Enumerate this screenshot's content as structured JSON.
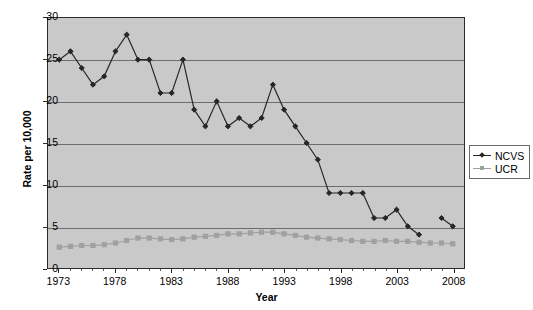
{
  "chart_data": {
    "type": "line",
    "title": "",
    "xlabel": "Year",
    "ylabel": "Rate per 10,000",
    "xlim": [
      1972,
      2009
    ],
    "ylim": [
      0,
      30
    ],
    "ytick_values": [
      0,
      5,
      10,
      15,
      20,
      25,
      30
    ],
    "ytick_labels": [
      "0",
      "5",
      "10",
      "15",
      "20",
      "25",
      "30"
    ],
    "xtick_values": [
      1973,
      1978,
      1983,
      1988,
      1993,
      1998,
      2003,
      2008
    ],
    "xtick_labels": [
      "1973",
      "1978",
      "1983",
      "1988",
      "1993",
      "1998",
      "2003",
      "2008"
    ],
    "grid": "horizontal",
    "legend_position": "right",
    "plot_background": "#c9c9c9",
    "x": [
      1973,
      1974,
      1975,
      1976,
      1977,
      1978,
      1979,
      1980,
      1981,
      1982,
      1983,
      1984,
      1985,
      1986,
      1987,
      1988,
      1989,
      1990,
      1991,
      1992,
      1993,
      1994,
      1995,
      1996,
      1997,
      1998,
      1999,
      2000,
      2001,
      2002,
      2003,
      2004,
      2005,
      2006,
      2007,
      2008
    ],
    "series": [
      {
        "name": "NCVS",
        "color": "#262626",
        "marker": "diamond",
        "values": [
          25,
          26,
          24,
          22,
          23,
          26,
          28,
          25,
          25,
          21,
          21,
          25,
          19,
          17,
          20,
          17,
          18,
          17,
          18,
          22,
          19,
          17,
          15,
          13,
          9,
          9,
          9,
          9,
          6,
          6,
          7,
          5,
          4,
          null,
          6,
          5
        ]
      },
      {
        "name": "UCR",
        "color": "#a0a0a0",
        "marker": "square",
        "values": [
          2.5,
          2.6,
          2.7,
          2.7,
          2.8,
          3.0,
          3.3,
          3.6,
          3.6,
          3.5,
          3.4,
          3.5,
          3.7,
          3.8,
          3.9,
          4.1,
          4.1,
          4.2,
          4.3,
          4.3,
          4.1,
          3.9,
          3.7,
          3.6,
          3.5,
          3.4,
          3.3,
          3.2,
          3.2,
          3.3,
          3.2,
          3.2,
          3.1,
          3.0,
          3.0,
          2.9
        ]
      }
    ],
    "legend": [
      {
        "label": "NCVS",
        "color": "#262626",
        "marker": "diamond"
      },
      {
        "label": "UCR",
        "color": "#a0a0a0",
        "marker": "square"
      }
    ]
  }
}
